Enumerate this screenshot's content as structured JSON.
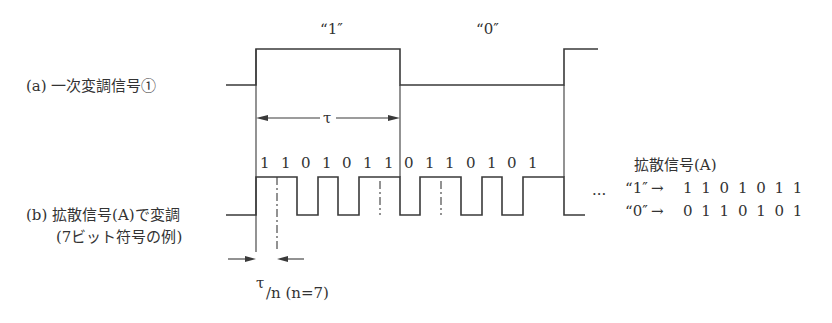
{
  "diagram": {
    "top_label_1": "“1″",
    "top_label_0": "“0″",
    "label_a": "(a)  一次変調信号①",
    "label_b_line1": "(b)  拡散信号(A)で変調",
    "label_b_line2": "(7ビット符号の例)",
    "tau_label": "τ",
    "chip_label_tau": "τ",
    "chip_label_rest": "/n (n=7)",
    "chip_bits": [
      "1",
      "1",
      "0",
      "1",
      "0",
      "1",
      "1",
      "0",
      "1",
      "1",
      "0",
      "1",
      "0",
      "1"
    ],
    "legend_title": "拡散信号(A)",
    "legend_row_1_key": "“1″",
    "legend_row_1_arrow": "→",
    "legend_row_1_code": "1 1 0 1 0 1 1",
    "legend_row_0_key": "“0″",
    "legend_row_0_arrow": "→",
    "legend_row_0_code": "0 1 1 0 1 0 1",
    "ellipsis": "···"
  }
}
